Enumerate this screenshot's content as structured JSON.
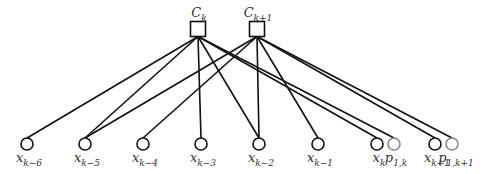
{
  "diagram": {
    "type": "factor-graph",
    "factors": [
      {
        "id": "Ck",
        "base": "C",
        "sub": "k",
        "x": 198,
        "y": 29
      },
      {
        "id": "Ck1",
        "base": "C",
        "sub": "k+1",
        "x": 257,
        "y": 29
      }
    ],
    "variables": [
      {
        "id": "xk6",
        "base": "x",
        "sub": "k−6",
        "x": 27,
        "y": 144,
        "kind": "hidden"
      },
      {
        "id": "xk5",
        "base": "x",
        "sub": "k−5",
        "x": 85,
        "y": 144,
        "kind": "hidden"
      },
      {
        "id": "xk4",
        "base": "x",
        "sub": "k−4",
        "x": 143,
        "y": 144,
        "kind": "hidden"
      },
      {
        "id": "xk3",
        "base": "x",
        "sub": "k−3",
        "x": 201,
        "y": 144,
        "kind": "hidden"
      },
      {
        "id": "xk2",
        "base": "x",
        "sub": "k−2",
        "x": 259,
        "y": 144,
        "kind": "hidden"
      },
      {
        "id": "xk1",
        "base": "x",
        "sub": "k−1",
        "x": 318,
        "y": 144,
        "kind": "hidden"
      },
      {
        "id": "xk",
        "base": "x",
        "sub": "k",
        "x": 377,
        "y": 144,
        "kind": "hidden"
      },
      {
        "id": "p1k",
        "base": "p",
        "sub": "1,k",
        "x": 394,
        "y": 144,
        "kind": "observed"
      },
      {
        "id": "xkp1",
        "base": "x",
        "sub": "k+1",
        "x": 435,
        "y": 144,
        "kind": "hidden"
      },
      {
        "id": "p1kp1",
        "base": "p",
        "sub": "1,k+1",
        "x": 452,
        "y": 144,
        "kind": "observed"
      }
    ],
    "edges": [
      [
        "Ck",
        "xk6"
      ],
      [
        "Ck",
        "xk5"
      ],
      [
        "Ck",
        "xk3"
      ],
      [
        "Ck",
        "xk2"
      ],
      [
        "Ck",
        "xk"
      ],
      [
        "Ck",
        "p1k"
      ],
      [
        "Ck1",
        "xk5"
      ],
      [
        "Ck1",
        "xk4"
      ],
      [
        "Ck1",
        "xk2"
      ],
      [
        "Ck1",
        "xk1"
      ],
      [
        "Ck1",
        "xkp1"
      ],
      [
        "Ck1",
        "p1kp1"
      ]
    ],
    "colors": {
      "line": "#111111",
      "observed": "#888888",
      "text": "#333333"
    }
  }
}
